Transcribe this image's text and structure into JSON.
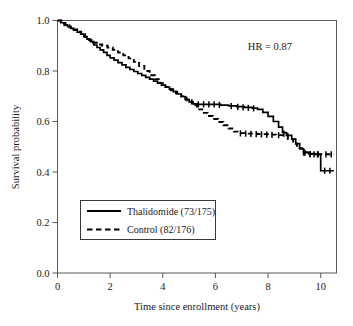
{
  "chart_data": {
    "type": "line",
    "title": "",
    "xlabel": "Time since enrollment (years)",
    "ylabel": "Survival probability",
    "xlim": [
      0,
      10.6
    ],
    "ylim": [
      0,
      1.0
    ],
    "xticks": [
      0,
      2,
      4,
      6,
      8,
      10
    ],
    "xtick_labels": [
      "0",
      "2",
      "4",
      "6",
      "8",
      "10"
    ],
    "yticks": [
      0.0,
      0.2,
      0.4,
      0.6,
      0.8,
      1.0
    ],
    "ytick_labels": [
      "0.0",
      "0.2",
      "0.4",
      "0.6",
      "0.8",
      "1.0"
    ],
    "grid": false,
    "legend_position": "lower-left",
    "annotations": [
      {
        "name": "hazard-ratio",
        "text": "HR = 0.87",
        "x": 8.1,
        "y": 0.9
      }
    ],
    "series": [
      {
        "name": "Thalidomide (73/175)",
        "label": "Thalidomide (73/175)",
        "style": "solid",
        "color": "#000000",
        "events": "73",
        "total": "175",
        "points": [
          [
            0.0,
            1.0
          ],
          [
            0.12,
            0.991
          ],
          [
            0.25,
            0.983
          ],
          [
            0.38,
            0.977
          ],
          [
            0.5,
            0.969
          ],
          [
            0.62,
            0.962
          ],
          [
            0.75,
            0.954
          ],
          [
            0.88,
            0.946
          ],
          [
            1.0,
            0.936
          ],
          [
            1.12,
            0.926
          ],
          [
            1.25,
            0.916
          ],
          [
            1.38,
            0.903
          ],
          [
            1.5,
            0.893
          ],
          [
            1.62,
            0.884
          ],
          [
            1.75,
            0.874
          ],
          [
            1.88,
            0.862
          ],
          [
            2.0,
            0.852
          ],
          [
            2.15,
            0.843
          ],
          [
            2.3,
            0.833
          ],
          [
            2.45,
            0.824
          ],
          [
            2.6,
            0.814
          ],
          [
            2.75,
            0.806
          ],
          [
            2.9,
            0.798
          ],
          [
            3.05,
            0.79
          ],
          [
            3.2,
            0.783
          ],
          [
            3.35,
            0.775
          ],
          [
            3.5,
            0.768
          ],
          [
            3.65,
            0.76
          ],
          [
            3.8,
            0.752
          ],
          [
            3.95,
            0.744
          ],
          [
            4.1,
            0.736
          ],
          [
            4.25,
            0.728
          ],
          [
            4.4,
            0.718
          ],
          [
            4.55,
            0.709
          ],
          [
            4.7,
            0.699
          ],
          [
            4.85,
            0.688
          ],
          [
            5.0,
            0.678
          ],
          [
            5.15,
            0.67
          ],
          [
            5.3,
            0.668
          ],
          [
            5.6,
            0.668
          ],
          [
            5.9,
            0.668
          ],
          [
            6.2,
            0.665
          ],
          [
            6.5,
            0.662
          ],
          [
            6.8,
            0.659
          ],
          [
            7.1,
            0.656
          ],
          [
            7.4,
            0.653
          ],
          [
            7.6,
            0.648
          ],
          [
            7.8,
            0.636
          ],
          [
            8.0,
            0.62
          ],
          [
            8.2,
            0.6
          ],
          [
            8.4,
            0.578
          ],
          [
            8.55,
            0.556
          ],
          [
            8.7,
            0.545
          ],
          [
            8.9,
            0.53
          ],
          [
            9.05,
            0.512
          ],
          [
            9.2,
            0.492
          ],
          [
            9.35,
            0.477
          ],
          [
            9.55,
            0.472
          ],
          [
            9.8,
            0.47
          ],
          [
            9.98,
            0.47
          ],
          [
            10.0,
            0.405
          ],
          [
            10.5,
            0.405
          ]
        ],
        "censor_points": [
          [
            5.35,
            0.668
          ],
          [
            5.55,
            0.668
          ],
          [
            5.75,
            0.668
          ],
          [
            5.95,
            0.668
          ],
          [
            6.15,
            0.666
          ],
          [
            6.6,
            0.661
          ],
          [
            6.85,
            0.658
          ],
          [
            7.05,
            0.656
          ],
          [
            7.25,
            0.654
          ],
          [
            7.45,
            0.652
          ],
          [
            8.6,
            0.552
          ],
          [
            8.75,
            0.542
          ],
          [
            9.4,
            0.476
          ],
          [
            9.6,
            0.471
          ],
          [
            9.75,
            0.47
          ],
          [
            9.88,
            0.47
          ],
          [
            10.15,
            0.405
          ],
          [
            10.35,
            0.405
          ]
        ]
      },
      {
        "name": "Control (82/176)",
        "label": "Control (82/176)",
        "style": "dashed",
        "color": "#000000",
        "events": "82",
        "total": "176",
        "points": [
          [
            0.0,
            1.0
          ],
          [
            0.15,
            0.99
          ],
          [
            0.3,
            0.981
          ],
          [
            0.45,
            0.973
          ],
          [
            0.6,
            0.965
          ],
          [
            0.75,
            0.956
          ],
          [
            0.9,
            0.946
          ],
          [
            1.05,
            0.934
          ],
          [
            1.2,
            0.923
          ],
          [
            1.35,
            0.912
          ],
          [
            1.5,
            0.905
          ],
          [
            1.7,
            0.9
          ],
          [
            1.9,
            0.893
          ],
          [
            2.1,
            0.884
          ],
          [
            2.3,
            0.873
          ],
          [
            2.5,
            0.862
          ],
          [
            2.7,
            0.85
          ],
          [
            2.9,
            0.836
          ],
          [
            3.1,
            0.82
          ],
          [
            3.3,
            0.8
          ],
          [
            3.5,
            0.783
          ],
          [
            3.7,
            0.768
          ],
          [
            3.9,
            0.752
          ],
          [
            4.1,
            0.737
          ],
          [
            4.3,
            0.724
          ],
          [
            4.5,
            0.712
          ],
          [
            4.7,
            0.7
          ],
          [
            4.9,
            0.684
          ],
          [
            5.1,
            0.665
          ],
          [
            5.3,
            0.648
          ],
          [
            5.5,
            0.634
          ],
          [
            5.7,
            0.622
          ],
          [
            5.9,
            0.61
          ],
          [
            6.1,
            0.598
          ],
          [
            6.3,
            0.585
          ],
          [
            6.5,
            0.572
          ],
          [
            6.7,
            0.56
          ],
          [
            6.9,
            0.554
          ],
          [
            7.2,
            0.552
          ],
          [
            7.6,
            0.55
          ],
          [
            8.0,
            0.548
          ],
          [
            8.3,
            0.546
          ],
          [
            8.55,
            0.545
          ],
          [
            8.75,
            0.53
          ],
          [
            8.95,
            0.512
          ],
          [
            9.1,
            0.494
          ],
          [
            9.3,
            0.478
          ],
          [
            9.5,
            0.472
          ],
          [
            9.75,
            0.47
          ],
          [
            10.1,
            0.47
          ],
          [
            10.5,
            0.47
          ]
        ],
        "censor_points": [
          [
            6.95,
            0.553
          ],
          [
            7.15,
            0.552
          ],
          [
            7.35,
            0.551
          ],
          [
            7.55,
            0.55
          ],
          [
            7.75,
            0.549
          ],
          [
            7.95,
            0.548
          ],
          [
            8.15,
            0.547
          ],
          [
            8.4,
            0.546
          ],
          [
            9.35,
            0.477
          ],
          [
            9.6,
            0.471
          ],
          [
            9.9,
            0.47
          ],
          [
            10.2,
            0.47
          ],
          [
            10.4,
            0.47
          ]
        ]
      }
    ]
  },
  "legend": {
    "items": [
      {
        "label": "Thalidomide (73/175)",
        "style": "solid"
      },
      {
        "label": "Control (82/176)",
        "style": "dashed"
      }
    ]
  }
}
